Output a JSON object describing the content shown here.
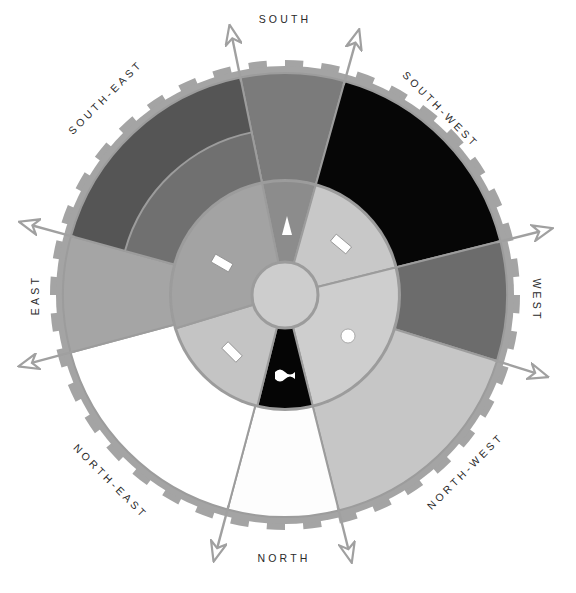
{
  "diagram": {
    "center": [
      285,
      295
    ],
    "radii": {
      "center_hub": 33,
      "inner_disc": 115,
      "inner_band": 166,
      "outer": 222,
      "ring_outer": 229,
      "teeth": 235
    },
    "colors": {
      "ring": "#a4a4a4",
      "divider": "#9c9c9c",
      "arrow": "#a0a0a0",
      "hub": "#cdcdcd",
      "label": "#2a2a2a",
      "symbol": "#ffffff"
    },
    "outer_sectors": [
      {
        "name": "south",
        "label": "SOUTH",
        "start": -101.6,
        "end": -74.4,
        "color": "#7b7b7b"
      },
      {
        "name": "south-west",
        "label": "SOUTH-WEST",
        "start": -74.4,
        "end": -14.0,
        "color": "#060606"
      },
      {
        "name": "west",
        "label": "WEST",
        "start": -14.0,
        "end": 17.3,
        "color": "#6c6c6c"
      },
      {
        "name": "north-west",
        "label": "NORTH-WEST",
        "start": 17.3,
        "end": 76.0,
        "color": "#c6c6c6"
      },
      {
        "name": "north",
        "label": "NORTH",
        "start": 76.0,
        "end": 105.0,
        "color": "#fdfdfd"
      },
      {
        "name": "north-east",
        "label": "NORTH-EAST",
        "start": 105.0,
        "end": 165.0,
        "color": "#ffffff"
      },
      {
        "name": "east",
        "label": "EAST",
        "start": 165.0,
        "end": 195.4,
        "color": "#a5a5a5"
      },
      {
        "name": "south-east",
        "label": "SOUTH-EAST",
        "start": 195.4,
        "end": 258.4,
        "color": "#555555",
        "inner_band_color": "#707070"
      }
    ],
    "inner_sectors": [
      {
        "name": "inner-south",
        "start": -101.6,
        "end": -74.4,
        "color": "#8c8c8c",
        "symbol": "triangle"
      },
      {
        "name": "inner-south-west",
        "start": -74.4,
        "end": -14.0,
        "color": "#c8c8c8",
        "symbol": "bar"
      },
      {
        "name": "inner-north-west",
        "start": -14.0,
        "end": 76.0,
        "color": "#cecece",
        "symbol": "circle"
      },
      {
        "name": "inner-north",
        "start": 76.0,
        "end": 104.0,
        "color": "#050505",
        "symbol": "wave"
      },
      {
        "name": "inner-north-east",
        "start": 104.0,
        "end": 163.0,
        "color": "#c4c4c4",
        "symbol": "bar"
      },
      {
        "name": "inner-south-east",
        "start": 163.0,
        "end": 258.4,
        "color": "#a3a3a3",
        "symbol": "bar"
      }
    ],
    "arrows": [
      -101.6,
      -74.4,
      -14.0,
      17.3,
      76.0,
      105.0,
      165.0,
      195.4
    ],
    "labels": [
      {
        "text": "SOUTH",
        "x": 285,
        "y": 20,
        "rotate": 0
      },
      {
        "text": "SOUTH-WEST",
        "x": 440,
        "y": 110,
        "rotate": 45
      },
      {
        "text": "WEST",
        "x": 536,
        "y": 300,
        "rotate": 90
      },
      {
        "text": "NORTH-WEST",
        "x": 466,
        "y": 472,
        "rotate": -45
      },
      {
        "text": "NORTH",
        "x": 284,
        "y": 559,
        "rotate": 0
      },
      {
        "text": "NORTH-EAST",
        "x": 110,
        "y": 482,
        "rotate": 45
      },
      {
        "text": "EAST",
        "x": 36,
        "y": 295,
        "rotate": -90
      },
      {
        "text": "SOUTH-EAST",
        "x": 106,
        "y": 98,
        "rotate": -45
      }
    ],
    "symbols": [
      {
        "type": "triangle",
        "x": 287,
        "y": 226
      },
      {
        "type": "bar",
        "x": 341,
        "y": 244,
        "rotate": 40
      },
      {
        "type": "bar",
        "x": 222,
        "y": 263,
        "rotate": 30
      },
      {
        "type": "circle",
        "x": 348,
        "y": 336
      },
      {
        "type": "bar",
        "x": 232,
        "y": 352,
        "rotate": 45
      },
      {
        "type": "wave",
        "x": 285,
        "y": 375
      }
    ]
  }
}
